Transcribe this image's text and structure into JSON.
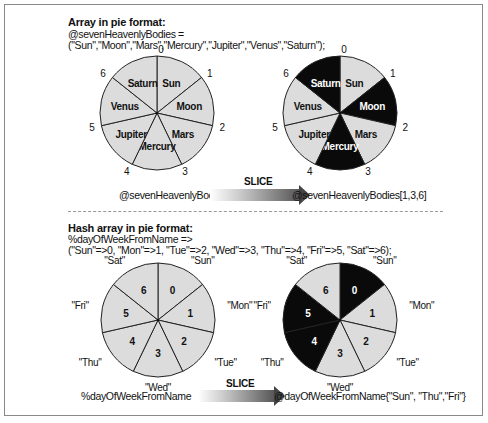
{
  "colors": {
    "light_fill": "#dcdcdc",
    "dark_fill": "#0a0a0a",
    "stroke": "#222222",
    "frame": "#888888"
  },
  "top_section": {
    "title": "Array in pie format:",
    "line1": "@sevenHeavenlyBodies =",
    "line2": "(\"Sun\",\"Moon\",\"Mars\",\"Mercury\",\"Jupiter\",\"Venus\",\"Saturn\");",
    "source_caption": "@sevenHeavenlyBodies",
    "arrow_label": "SLICE",
    "result_caption": "@sevenHeavenlyBodies[1,3,6]"
  },
  "bottom_section": {
    "title": "Hash array in pie format:",
    "line1": "%dayOfWeekFromName =>",
    "line2": "(\"Sun\"=>0, \"Mon\"=>1, \"Tue\"=>2, \"Wed\"=>3, \"Thu\"=>4, \"Fri\"=>5, \"Sat\"=>6);",
    "source_caption": "%dayOfWeekFromName",
    "arrow_label": "SLICE",
    "result_caption": "@dayOfWeekFromName{\"Sun\", \"Thu\",\"Fri\"}"
  },
  "pies": [
    {
      "id": "array-original",
      "cx": 157,
      "cy": 113,
      "r": 57,
      "inner": [
        "Sun",
        "Moon",
        "Mars",
        "Mercury",
        "Jupiter",
        "Venus",
        "Saturn"
      ],
      "outer": [
        "0",
        "1",
        "2",
        "3",
        "4",
        "5",
        "6"
      ],
      "dark": []
    },
    {
      "id": "array-sliced",
      "cx": 340,
      "cy": 113,
      "r": 57,
      "inner": [
        "Sun",
        "Moon",
        "Mars",
        "Mercury",
        "Jupiter",
        "Venus",
        "Saturn"
      ],
      "outer": [
        "0",
        "1",
        "2",
        "3",
        "4",
        "5",
        "6"
      ],
      "dark": [
        1,
        3,
        6
      ]
    },
    {
      "id": "hash-original",
      "cx": 158,
      "cy": 320,
      "r": 57,
      "inner": [
        "0",
        "1",
        "2",
        "3",
        "4",
        "5",
        "6"
      ],
      "outer": [
        "\"Sun\"",
        "\"Mon\"",
        "\"Tue\"",
        "\"Wed\"",
        "\"Thu\"",
        "\"Fri\"",
        "\"Sat\""
      ],
      "dark": []
    },
    {
      "id": "hash-sliced",
      "cx": 340,
      "cy": 320,
      "r": 57,
      "inner": [
        "0",
        "1",
        "2",
        "3",
        "4",
        "5",
        "6"
      ],
      "outer": [
        "\"Sun\"",
        "\"Mon\"",
        "\"Tue\"",
        "\"Wed\"",
        "\"Thu\"",
        "\"Fri\"",
        "\"Sat\""
      ],
      "dark": [
        0,
        4,
        5
      ]
    }
  ]
}
